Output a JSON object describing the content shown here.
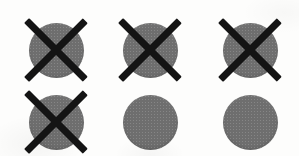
{
  "canvas": {
    "width": 299,
    "height": 156,
    "background_color": "#fdfdfc",
    "description": "Scanned sheet showing a three-by-two grid of gray filled circles; four of the six circles are struck through with a thick black X."
  },
  "style": {
    "disc_color": "#6e6e6e",
    "cross_color": "#141414",
    "cross_thickness_px": 7,
    "disc_diameter_px": 55,
    "cross_span_px": 64
  },
  "grid": {
    "columns": 3,
    "rows": 2,
    "total_items": 6,
    "crossed_count": 4,
    "uncrossed_count": 2,
    "column_centers_x": [
      56,
      150,
      250
    ],
    "row_centers_y": [
      50,
      122
    ]
  },
  "items": [
    {
      "id": "circle-r1c1",
      "row": 1,
      "column": 1,
      "center_x": 56,
      "center_y": 50,
      "diameter": 55,
      "crossed_out": true,
      "cross_span": 64,
      "state_label": "crossed-out"
    },
    {
      "id": "circle-r1c2",
      "row": 1,
      "column": 2,
      "center_x": 150,
      "center_y": 50,
      "diameter": 55,
      "crossed_out": true,
      "cross_span": 64,
      "state_label": "crossed-out"
    },
    {
      "id": "circle-r1c3",
      "row": 1,
      "column": 3,
      "center_x": 250,
      "center_y": 50,
      "diameter": 55,
      "crossed_out": true,
      "cross_span": 64,
      "state_label": "crossed-out"
    },
    {
      "id": "circle-r2c1",
      "row": 2,
      "column": 1,
      "center_x": 56,
      "center_y": 122,
      "diameter": 55,
      "crossed_out": true,
      "cross_span": 64,
      "state_label": "crossed-out"
    },
    {
      "id": "circle-r2c2",
      "row": 2,
      "column": 2,
      "center_x": 150,
      "center_y": 122,
      "diameter": 55,
      "crossed_out": false,
      "cross_span": 0,
      "state_label": "plain"
    },
    {
      "id": "circle-r2c3",
      "row": 2,
      "column": 3,
      "center_x": 250,
      "center_y": 122,
      "diameter": 55,
      "crossed_out": false,
      "cross_span": 0,
      "state_label": "plain"
    }
  ]
}
